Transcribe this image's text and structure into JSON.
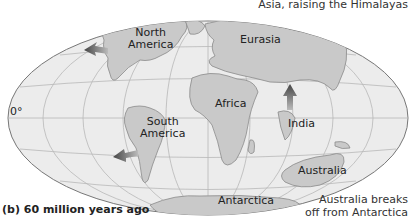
{
  "figure": {
    "caption": "(b) 60 million years ago",
    "equator_label": "0°",
    "colors": {
      "ocean": "#ebebeb",
      "land": "#c8c8c8",
      "coast": "#8a8a8a",
      "grid": "#b5b5b5",
      "arrow": "#555555"
    }
  },
  "continents": [
    {
      "name": "North America",
      "line1": "North",
      "line2": "America"
    },
    {
      "name": "Eurasia"
    },
    {
      "name": "Africa"
    },
    {
      "name": "South America",
      "line1": "South",
      "line2": "America"
    },
    {
      "name": "India"
    },
    {
      "name": "Australia"
    },
    {
      "name": "Antarctica"
    }
  ],
  "annotations": {
    "top_right": "Asia, raising the Himalayas",
    "bottom_right_line1": "Australia breaks",
    "bottom_right_line2": "off from Antarctica"
  }
}
